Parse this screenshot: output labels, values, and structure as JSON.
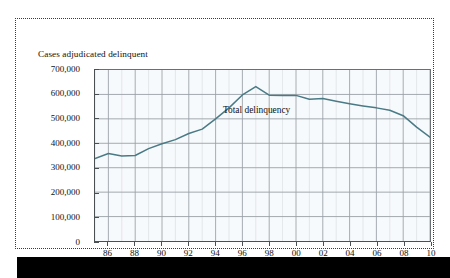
{
  "figure": {
    "y_axis_title": "Cases adjudicated delinquent",
    "x_axis_title": "Year",
    "series_annotation": "Total delinquency",
    "line_color": "#4a7a85",
    "grid_color": "#9aa0a6",
    "axis_color": "#4a4f54",
    "plot_background": "#f7fafc"
  },
  "chart_data": {
    "type": "line",
    "title": "",
    "xlabel": "Year",
    "ylabel": "Cases adjudicated delinquent",
    "xlim": [
      1985,
      2010
    ],
    "ylim": [
      0,
      700000
    ],
    "grid": true,
    "legend": "inline-annotation",
    "y_ticks": [
      0,
      100000,
      200000,
      300000,
      400000,
      500000,
      600000,
      700000
    ],
    "y_tick_labels": [
      "0",
      "100,000",
      "200,000",
      "300,000",
      "400,000",
      "500,000",
      "600,000",
      "700,000"
    ],
    "x_ticks": [
      1986,
      1988,
      1990,
      1992,
      1994,
      1996,
      1998,
      2000,
      2002,
      2004,
      2006,
      2008,
      2010
    ],
    "x_tick_labels": [
      "86",
      "88",
      "90",
      "92",
      "94",
      "96",
      "98",
      "00",
      "02",
      "04",
      "06",
      "08",
      "10"
    ],
    "series": [
      {
        "name": "Total delinquency",
        "color": "#4a7a85",
        "x": [
          1985,
          1986,
          1987,
          1988,
          1989,
          1990,
          1991,
          1992,
          1993,
          1994,
          1995,
          1996,
          1997,
          1998,
          1999,
          2000,
          2001,
          2002,
          2003,
          2004,
          2005,
          2006,
          2007,
          2008,
          2009,
          2010
        ],
        "values": [
          338000,
          358000,
          348000,
          350000,
          378000,
          398000,
          415000,
          440000,
          458000,
          500000,
          545000,
          598000,
          632000,
          597000,
          596000,
          596000,
          580000,
          583000,
          572000,
          562000,
          553000,
          545000,
          535000,
          513000,
          466000,
          425000
        ]
      }
    ]
  }
}
